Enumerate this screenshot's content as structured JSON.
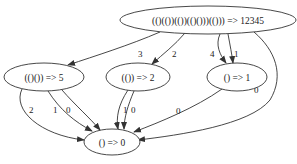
{
  "diagram": {
    "type": "directed-graph",
    "colors": {
      "stroke": "#333333",
      "text": "#222222",
      "background": "#ffffff"
    },
    "nodes": [
      {
        "id": "root",
        "label": "(()(())(())(()()))(())) => 12345",
        "cx": 208,
        "cy": 20,
        "rx": 88,
        "ry": 14
      },
      {
        "id": "n5",
        "label": "(()()) => 5",
        "cx": 44,
        "cy": 77,
        "rx": 40,
        "ry": 14
      },
      {
        "id": "n2",
        "label": "(()) => 2",
        "cx": 138,
        "cy": 77,
        "rx": 32,
        "ry": 14
      },
      {
        "id": "n1",
        "label": "() => 1",
        "cx": 237,
        "cy": 77,
        "rx": 30,
        "ry": 14
      },
      {
        "id": "n0",
        "label": "() => 0",
        "cx": 112,
        "cy": 142,
        "rx": 28,
        "ry": 13
      }
    ],
    "edges": [
      {
        "from": "root",
        "to": "n5",
        "label": "3"
      },
      {
        "from": "root",
        "to": "n2",
        "label": "2"
      },
      {
        "from": "root",
        "to": "n1",
        "label": "4"
      },
      {
        "from": "root",
        "to": "n1",
        "label": "1"
      },
      {
        "from": "root",
        "to": "n0",
        "label": "0"
      },
      {
        "from": "n5",
        "to": "n0",
        "label": "2"
      },
      {
        "from": "n5",
        "to": "n0",
        "label": "1"
      },
      {
        "from": "n5",
        "to": "n0",
        "label": "0"
      },
      {
        "from": "n2",
        "to": "n0",
        "label": "1"
      },
      {
        "from": "n2",
        "to": "n0",
        "label": "0"
      },
      {
        "from": "n1",
        "to": "n0",
        "label": "0"
      }
    ]
  }
}
